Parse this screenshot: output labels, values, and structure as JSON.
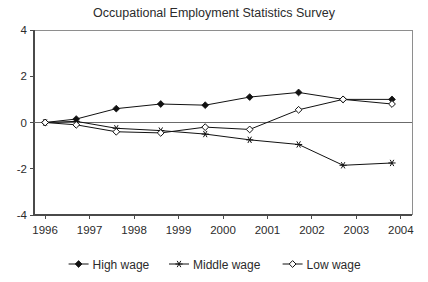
{
  "chart_data": {
    "type": "line",
    "title": "Occupational Employment Statistics Survey",
    "xlabel": "",
    "ylabel": "",
    "xlim": [
      1995.75,
      2004.25
    ],
    "ylim": [
      -4,
      4
    ],
    "yticks": [
      4,
      2,
      0,
      -2,
      -4
    ],
    "ytick_labels": [
      "4",
      "2",
      "0",
      "-2",
      "-4"
    ],
    "xticks": [
      1996,
      1997,
      1998,
      1999,
      2000,
      2001,
      2002,
      2003,
      2004
    ],
    "xtick_labels": [
      "1996",
      "1997",
      "1998",
      "1999",
      "2000",
      "2001",
      "2002",
      "2003",
      "2004"
    ],
    "grid": false,
    "zero_line": true,
    "legend_position": "bottom",
    "x": [
      1996,
      1996.7,
      1997.6,
      1998.6,
      1999.6,
      2000.6,
      2001.7,
      2002.7,
      2003.8
    ],
    "series": [
      {
        "name": "High wage",
        "marker": "filled-diamond",
        "values": [
          0.0,
          0.15,
          0.6,
          0.8,
          0.75,
          1.1,
          1.3,
          1.0,
          1.0
        ]
      },
      {
        "name": "Middle wage",
        "marker": "star",
        "values": [
          0.0,
          0.05,
          -0.25,
          -0.35,
          -0.5,
          -0.75,
          -0.95,
          -1.85,
          -1.75
        ]
      },
      {
        "name": "Low wage",
        "marker": "open-diamond",
        "values": [
          0.0,
          -0.1,
          -0.4,
          -0.45,
          -0.2,
          -0.3,
          0.55,
          1.0,
          0.8
        ]
      }
    ],
    "colors": {
      "line": "#111111",
      "axis": "#4a4a4a",
      "frame": "#8e8e8e",
      "text": "#2b2b2b",
      "background": "#ffffff"
    }
  },
  "legend": {
    "entries": [
      {
        "label": "High wage",
        "marker": "filled-diamond"
      },
      {
        "label": "Middle wage",
        "marker": "star"
      },
      {
        "label": "Low wage",
        "marker": "open-diamond"
      }
    ]
  }
}
